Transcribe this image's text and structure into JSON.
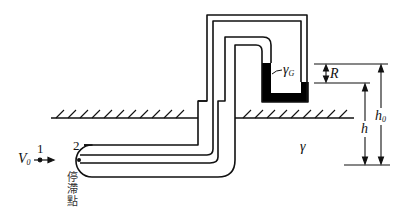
{
  "diagram": {
    "type": "pitot-static tube with differential manometer",
    "labels": {
      "velocity": "V",
      "velocity_sub": "0",
      "point1": "1",
      "point2": "2",
      "stagnation_point_chars": [
        "停",
        "滯",
        "點"
      ],
      "manometer_fluid": "γ",
      "manometer_fluid_sub": "G",
      "flow_fluid": "γ",
      "reading": "R",
      "height": "h",
      "height0": "h",
      "height0_sub": "0"
    },
    "colors": {
      "line": "#111111",
      "manometer_fluid": "#000000",
      "background": "#ffffff"
    }
  }
}
